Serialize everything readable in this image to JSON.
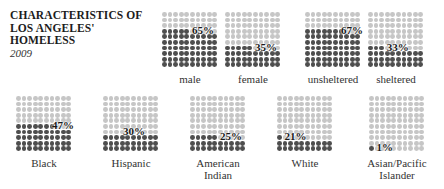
{
  "header": {
    "title_lines": [
      "CHARACTERISTICS OF",
      "LOS ANGELES'",
      "HOMELESS"
    ],
    "subtitle": "2009"
  },
  "colors": {
    "light_dot": "#c6c6c6",
    "dark_dot": "#4e4e4e"
  },
  "panels": [
    {
      "label_lines": [
        "male"
      ],
      "pct_label": "65%",
      "value": 65
    },
    {
      "label_lines": [
        "female"
      ],
      "pct_label": "35%",
      "value": 35
    },
    {
      "label_lines": [
        "unsheltered"
      ],
      "pct_label": "67%",
      "value": 67
    },
    {
      "label_lines": [
        "sheltered"
      ],
      "pct_label": "33%",
      "value": 33
    },
    {
      "label_lines": [
        "Black"
      ],
      "pct_label": "47%",
      "value": 47
    },
    {
      "label_lines": [
        "Hispanic"
      ],
      "pct_label": "30%",
      "value": 30
    },
    {
      "label_lines": [
        "American",
        "Indian"
      ],
      "pct_label": "25%",
      "value": 25
    },
    {
      "label_lines": [
        "White"
      ],
      "pct_label": "21%",
      "value": 21
    },
    {
      "label_lines": [
        "Asian/Pacific",
        "Islander"
      ],
      "pct_label": "1%",
      "value": 1
    }
  ],
  "chart_data": {
    "type": "waffle",
    "title": "Characteristics of Los Angeles' Homeless",
    "subtitle": "2009",
    "grid": "10x10 dots, each dot = 1%",
    "groups": [
      {
        "name": "Gender",
        "categories": [
          "male",
          "female"
        ],
        "values": [
          65,
          35
        ]
      },
      {
        "name": "Shelter status",
        "categories": [
          "unsheltered",
          "sheltered"
        ],
        "values": [
          67,
          33
        ]
      },
      {
        "name": "Race/Ethnicity",
        "categories": [
          "Black",
          "Hispanic",
          "American Indian",
          "White",
          "Asian/Pacific Islander"
        ],
        "values": [
          47,
          30,
          25,
          21,
          1
        ]
      }
    ],
    "unit": "%"
  }
}
